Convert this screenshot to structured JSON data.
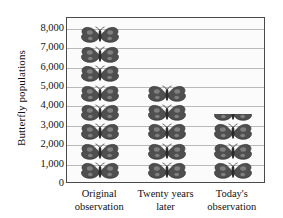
{
  "chart_data": {
    "type": "bar",
    "subtype": "pictograph",
    "title": "",
    "xlabel": "",
    "ylabel": "Butterfly populations",
    "categories": [
      "Original observation",
      "Twenty years later",
      "Today's observation"
    ],
    "category_lines": [
      [
        "Original",
        "observation"
      ],
      [
        "Twenty years",
        "later"
      ],
      [
        "Today's",
        "observation"
      ]
    ],
    "values": [
      7500,
      4500,
      3500
    ],
    "icon_counts": [
      8,
      5,
      3.5
    ],
    "icon_unit_value": 1000,
    "icon": "butterfly-icon",
    "ylim": [
      0,
      8500
    ],
    "ytick_values": [
      0,
      1000,
      2000,
      3000,
      4000,
      5000,
      6000,
      7000,
      8000
    ],
    "ytick_labels": [
      "0",
      "1,000",
      "2,000",
      "3,000",
      "4,000",
      "5,000",
      "6,000",
      "7,000",
      "8,000"
    ],
    "grid": true,
    "grid_axis": "y",
    "legend": false,
    "colors": {
      "icon_fill": "#4f4f4f",
      "icon_stroke": "#2b2b2b",
      "plot_background": "#fbfbfb",
      "gridline": "#b9b9b9",
      "frame": "#4a4a4a",
      "text": "#111111",
      "page_background": "#ffffff"
    }
  }
}
